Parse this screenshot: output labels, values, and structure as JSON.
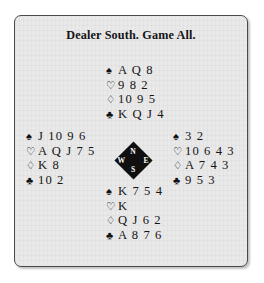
{
  "diagram": {
    "title": "Dealer South. Game All.",
    "suit_glyphs": {
      "spade": "♠",
      "heart": "♡",
      "diamond": "♢",
      "club": "♣"
    },
    "compass": {
      "north": "N",
      "south": "S",
      "west": "W",
      "east": "E"
    },
    "hands": {
      "north": {
        "label": "North",
        "spades": "A Q 8",
        "hearts": "9 8 2",
        "diamonds": "10 9 5",
        "clubs": "K Q J 4"
      },
      "west": {
        "label": "West",
        "spades": "J 10 9 6",
        "hearts": "A Q J 7 5",
        "diamonds": "K 8",
        "clubs": "10 2"
      },
      "east": {
        "label": "East",
        "spades": "3 2",
        "hearts": "10 6 4 3",
        "diamonds": "A 7 4 3",
        "clubs": "9 5 3"
      },
      "south": {
        "label": "South",
        "spades": "K 7 5 4",
        "hearts": "K",
        "diamonds": "Q J 6 2",
        "clubs": "A 8 7 6"
      }
    },
    "colors": {
      "card_background": "#e9e9e9",
      "border": "#4a4a4a",
      "text": "#141414",
      "compass_fill": "#101010",
      "compass_text": "#ffffff"
    }
  }
}
